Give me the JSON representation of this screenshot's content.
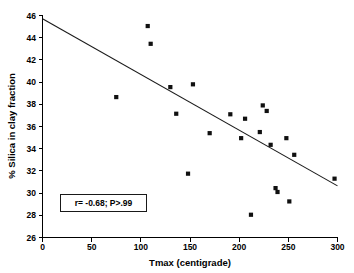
{
  "chart_data": {
    "type": "scatter",
    "title": "",
    "xlabel": "Tmax (centigrade)",
    "ylabel": "% Silica in clay fraction",
    "xlim": [
      0,
      300
    ],
    "ylim": [
      26,
      46
    ],
    "xticks": [
      0,
      50,
      100,
      150,
      200,
      250,
      300
    ],
    "yticks": [
      26,
      28,
      30,
      32,
      34,
      36,
      38,
      40,
      42,
      44,
      46
    ],
    "grid": false,
    "legend": "none",
    "annotation": "r= -0.68; P>.99",
    "correlation_r": -0.68,
    "p_text": "P>.99",
    "marker": "square",
    "marker_color": "#101010",
    "line_color": "#1a1a1a",
    "points": [
      {
        "x": 75,
        "y": 38.65
      },
      {
        "x": 107,
        "y": 45.05
      },
      {
        "x": 110,
        "y": 43.45
      },
      {
        "x": 130,
        "y": 39.55
      },
      {
        "x": 136,
        "y": 37.15
      },
      {
        "x": 148,
        "y": 31.75
      },
      {
        "x": 153,
        "y": 39.8
      },
      {
        "x": 170,
        "y": 35.4
      },
      {
        "x": 191,
        "y": 37.1
      },
      {
        "x": 202,
        "y": 34.95
      },
      {
        "x": 206,
        "y": 36.7
      },
      {
        "x": 212,
        "y": 28.05
      },
      {
        "x": 221,
        "y": 35.5
      },
      {
        "x": 224,
        "y": 37.9
      },
      {
        "x": 228,
        "y": 37.4
      },
      {
        "x": 232,
        "y": 34.35
      },
      {
        "x": 237,
        "y": 30.45
      },
      {
        "x": 239,
        "y": 30.1
      },
      {
        "x": 248,
        "y": 34.95
      },
      {
        "x": 251,
        "y": 29.25
      },
      {
        "x": 256,
        "y": 33.45
      },
      {
        "x": 297,
        "y": 31.3
      }
    ],
    "fit_line": {
      "x_start": 0,
      "y_start": 45.7,
      "x_end": 300,
      "y_end": 30.65
    }
  }
}
